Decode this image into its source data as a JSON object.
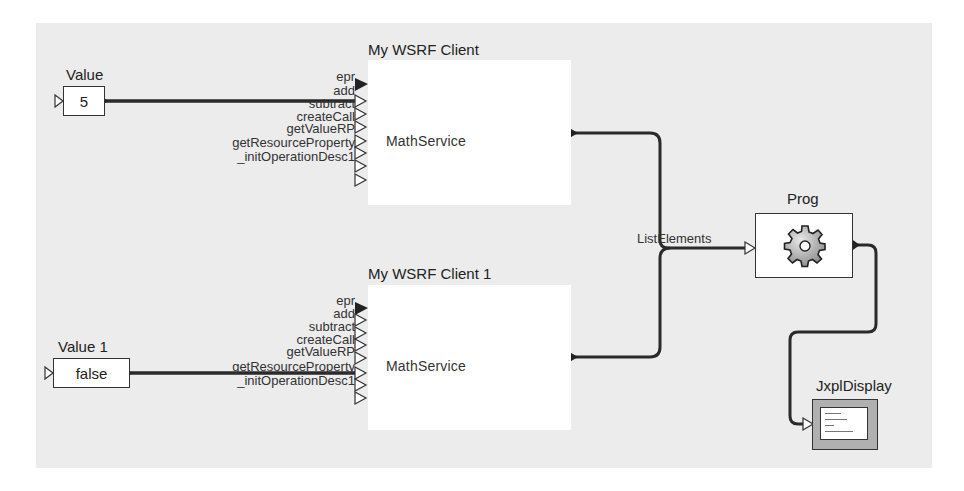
{
  "canvas": {
    "background": "#ececec"
  },
  "nodes": {
    "value": {
      "title": "Value",
      "value": "5"
    },
    "value1": {
      "title": "Value 1",
      "value": "false"
    },
    "client": {
      "title": "My WSRF Client",
      "service": "MathService",
      "ports": [
        "epr",
        "add",
        "subtract",
        "createCall",
        "getValueRP",
        "getResourceProperty",
        "_initOperationDesc1"
      ]
    },
    "client1": {
      "title": "My WSRF Client 1",
      "service": "MathService",
      "ports": [
        "epr",
        "add",
        "subtract",
        "createCall",
        "getValueRP",
        "getResourceProperty",
        "_initOperationDesc1"
      ]
    },
    "prog": {
      "title": "Prog",
      "icon": "gear-icon",
      "input_label": "ListElements"
    },
    "display": {
      "title": "JxplDisplay",
      "icon": "display-window-icon"
    }
  },
  "connections": [
    {
      "from": "Value.out",
      "to": "My WSRF Client.add"
    },
    {
      "from": "Value 1.out",
      "to": "My WSRF Client 1.getResourceProperty"
    },
    {
      "from": "My WSRF Client.out",
      "to": "Prog.ListElements"
    },
    {
      "from": "My WSRF Client 1.out",
      "to": "Prog.ListElements"
    },
    {
      "from": "Prog.out",
      "to": "JxplDisplay.in"
    }
  ],
  "colors": {
    "wire": "#2a2a2a",
    "node_border": "#333333",
    "node_fill": "#ffffff"
  }
}
